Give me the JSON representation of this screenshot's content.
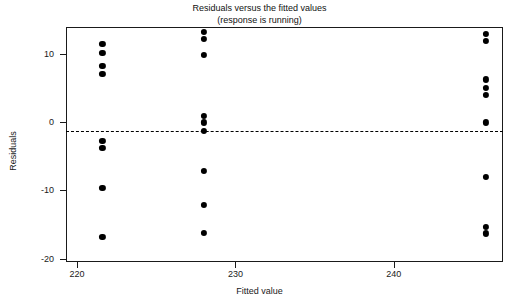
{
  "chart_data": {
    "type": "scatter",
    "title": "Residuals versus the fitted values",
    "subtitle": "(response is running)",
    "xlabel": "Fitted value",
    "ylabel": "Residuals",
    "xlim": [
      219.3,
      246.9
    ],
    "ylim": [
      -20.5,
      14.0
    ],
    "xticks": [
      220,
      230,
      240
    ],
    "xticklabels": [
      "220",
      "230",
      "240"
    ],
    "yticks": [
      10,
      0,
      -10,
      -20
    ],
    "yticklabels": [
      "10",
      "0",
      "-10",
      "-20"
    ],
    "grid": false,
    "legend": null,
    "reference_line": {
      "orientation": "horizontal",
      "y": 0,
      "style": "dashed"
    },
    "marker": {
      "shape": "circle",
      "filled": true,
      "color": "#000000",
      "size": 6
    },
    "points": [
      {
        "x": 221.6,
        "y": 11.5
      },
      {
        "x": 221.6,
        "y": 10.2
      },
      {
        "x": 221.6,
        "y": 8.3
      },
      {
        "x": 221.6,
        "y": 7.1
      },
      {
        "x": 221.6,
        "y": -2.7
      },
      {
        "x": 221.6,
        "y": -3.8
      },
      {
        "x": 221.6,
        "y": -9.6
      },
      {
        "x": 221.6,
        "y": -16.8
      },
      {
        "x": 228.0,
        "y": 13.3
      },
      {
        "x": 228.0,
        "y": 12.3
      },
      {
        "x": 228.0,
        "y": 9.9
      },
      {
        "x": 228.0,
        "y": 0.9
      },
      {
        "x": 228.0,
        "y": 0.0
      },
      {
        "x": 228.0,
        "y": -1.2
      },
      {
        "x": 228.0,
        "y": -7.1
      },
      {
        "x": 228.0,
        "y": -12.1
      },
      {
        "x": 228.0,
        "y": -16.2
      },
      {
        "x": 245.8,
        "y": 13.0
      },
      {
        "x": 245.8,
        "y": 11.9
      },
      {
        "x": 245.8,
        "y": 6.3
      },
      {
        "x": 245.8,
        "y": 5.0
      },
      {
        "x": 245.8,
        "y": 4.0
      },
      {
        "x": 245.8,
        "y": 0.0
      },
      {
        "x": 245.8,
        "y": -8.0
      },
      {
        "x": 245.8,
        "y": -15.3
      },
      {
        "x": 245.8,
        "y": -16.3
      }
    ]
  }
}
